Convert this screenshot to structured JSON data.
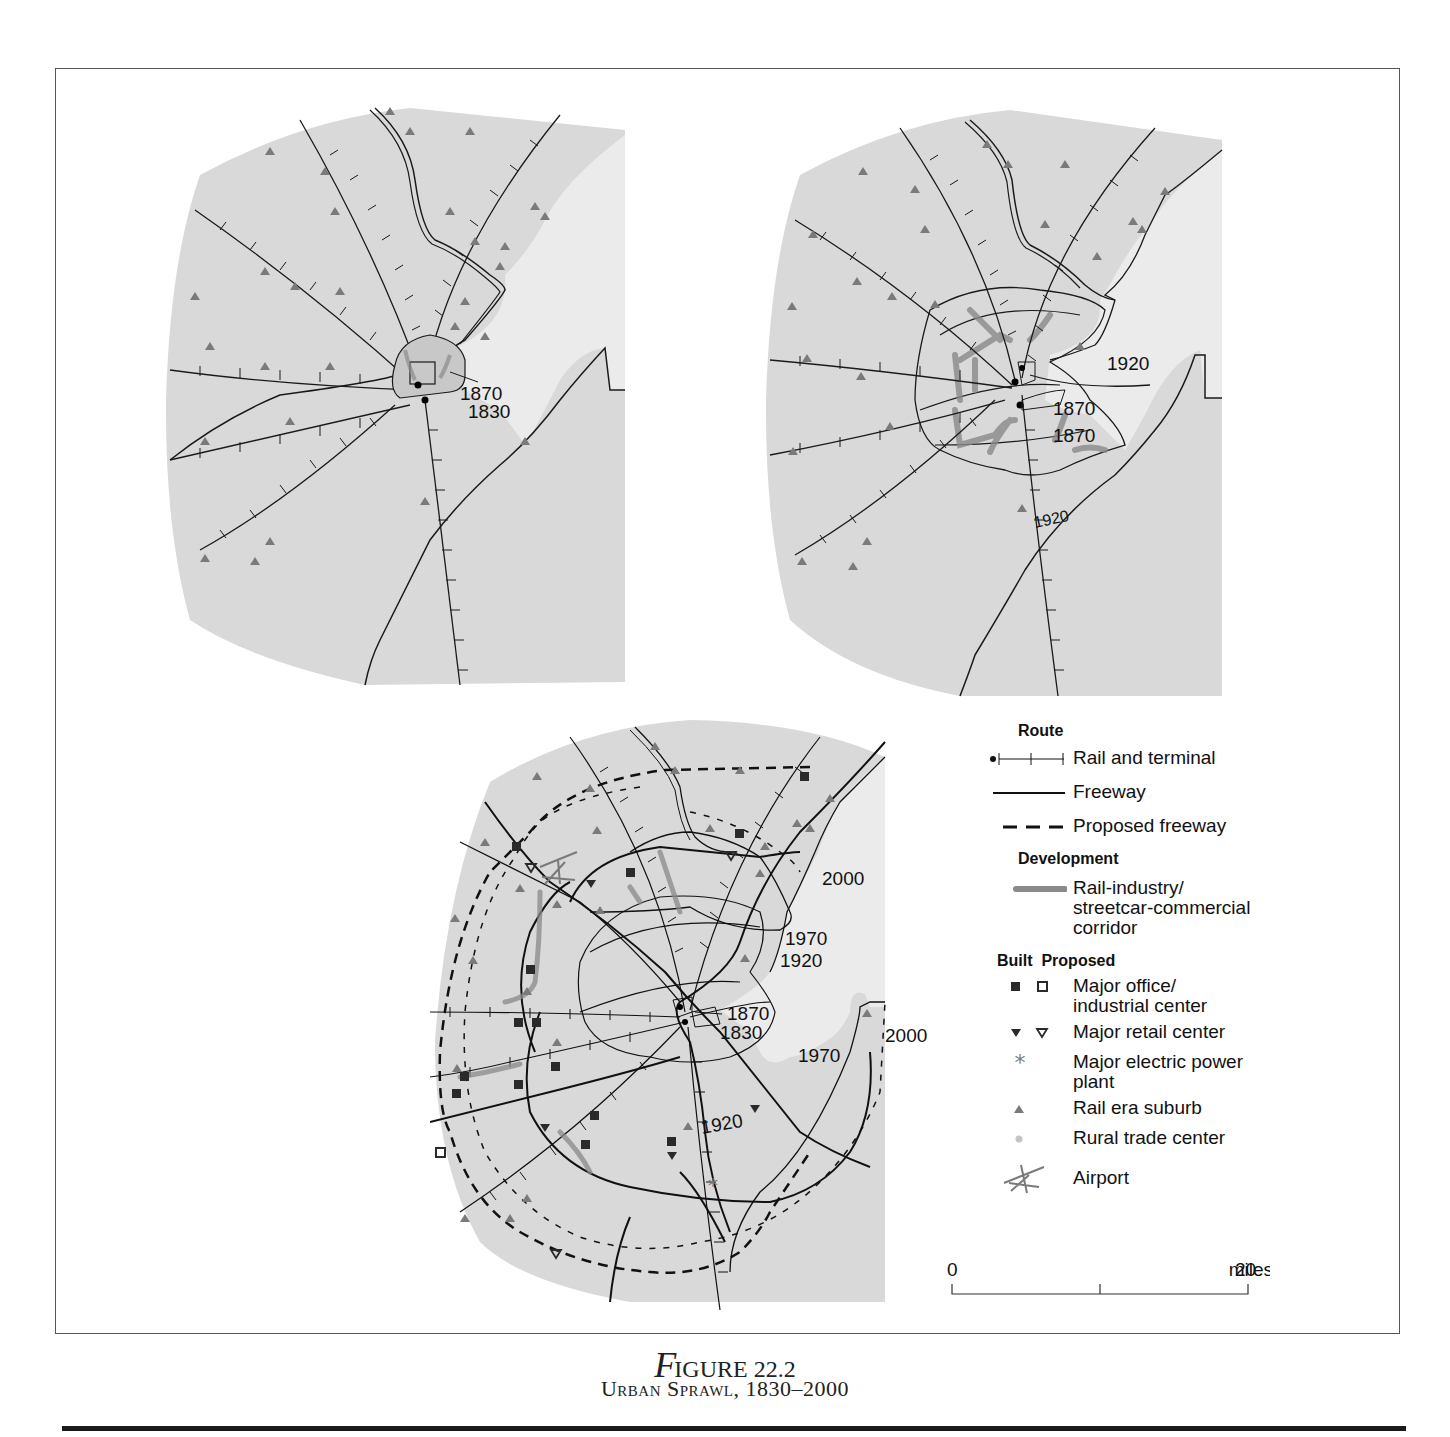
{
  "figure": {
    "number_prefix": "F",
    "number_rest": "IGURE 22.2",
    "title": "Urban Sprawl, 1830–2000"
  },
  "maps": {
    "map_1": {
      "labels": [
        "1870",
        "1830"
      ]
    },
    "map_2": {
      "labels": [
        "1920",
        "1870",
        "1870",
        "1920"
      ]
    },
    "map_3": {
      "labels": [
        "2000",
        "1970",
        "1920",
        "1870",
        "1830",
        "2000",
        "1970",
        "1920"
      ]
    }
  },
  "legend": {
    "route_header": "Route",
    "rail": "Rail and terminal",
    "freeway": "Freeway",
    "proposed_freeway": "Proposed freeway",
    "development_header": "Development",
    "corridor": "Rail-industry/ streetcar-commercial corridor",
    "corridor_line1": "Rail-industry/",
    "corridor_line2": "streetcar-commercial",
    "corridor_line3": "corridor",
    "built_header": "Built",
    "proposed_header": "Proposed",
    "office_line1": "Major office/",
    "office_line2": "industrial center",
    "retail": "Major retail center",
    "power_line1": "Major electric power",
    "power_line2": "plant",
    "suburb": "Rail era suburb",
    "rural": "Rural trade center",
    "airport": "Airport"
  },
  "scale_bar": {
    "start": "0",
    "end": "20",
    "unit": "miles"
  },
  "colors": {
    "land": "#d9d9d9",
    "water": "#ebebeb",
    "corridor": "#8a8a8a",
    "suburb_triangle": "#7a7a7a",
    "line": "#1a1a1a"
  }
}
